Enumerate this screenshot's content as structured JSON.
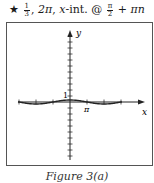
{
  "header": {
    "star": "★",
    "amplitude_num": "1",
    "amplitude_den": "3",
    "sep1": ",",
    "period": "2π",
    "sep2": ",",
    "xint_label": "x",
    "xint_rest": "-int. @",
    "offset_num": "π",
    "offset_den": "2",
    "offset_rest": "+ πn"
  },
  "caption": "Figure 3(a)",
  "chart_data": {
    "type": "line",
    "xlabel": "x",
    "ylabel": "y",
    "function": "y = (1/3) cos(x)",
    "amplitude": 0.3333,
    "period": "2π",
    "x_intercepts": "π/2 + πn",
    "xlim": [
      -3.2,
      3.7
    ],
    "ylim": [
      -10,
      12
    ],
    "x_ticks": [
      "-3π/2",
      "-π",
      "-π/2",
      "0",
      "π/2",
      "π",
      "3π/2"
    ],
    "labeled_ticks": {
      "x": "π",
      "y": "1"
    },
    "y_tick_spacing": 1,
    "grid": false,
    "series": [
      {
        "name": "y = (1/3)cos x",
        "x": [
          -4.712,
          -3.142,
          -1.571,
          0,
          1.571,
          3.142,
          4.712
        ],
        "values": [
          0,
          -0.333,
          0,
          0.333,
          0,
          -0.333,
          0
        ]
      }
    ]
  },
  "axis_labels": {
    "x": "x",
    "y": "y",
    "pi": "π",
    "one": "1"
  }
}
